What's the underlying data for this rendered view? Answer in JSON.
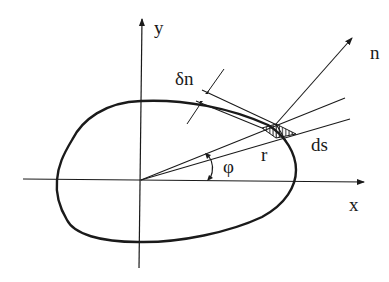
{
  "diagram": {
    "stroke_color": "#1a1a1a",
    "labels": {
      "y_axis": "y",
      "x_axis": "x",
      "normal": "n",
      "normal_displacement": "δn",
      "angle": "φ",
      "radius": "r",
      "arc_element": "ds"
    },
    "elements": [
      {
        "id": "x-axis",
        "kind": "arrow",
        "label": "x"
      },
      {
        "id": "y-axis",
        "kind": "arrow",
        "label": "y"
      },
      {
        "id": "closed-curve",
        "kind": "curve"
      },
      {
        "id": "ray-upper",
        "kind": "line",
        "from": "origin"
      },
      {
        "id": "ray-lower",
        "kind": "line",
        "from": "origin"
      },
      {
        "id": "normal-arrow",
        "kind": "arrow",
        "label": "n"
      },
      {
        "id": "displaced-tangent",
        "kind": "line"
      },
      {
        "id": "delta-n-dimension",
        "kind": "dimension",
        "label": "δn"
      },
      {
        "id": "hatched-element",
        "kind": "hatched-triangle"
      },
      {
        "id": "angle-arc",
        "kind": "arc-arrow",
        "label": "φ"
      }
    ]
  }
}
